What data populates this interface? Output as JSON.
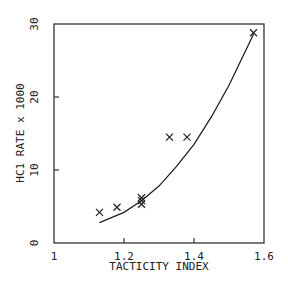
{
  "chart_data": {
    "type": "scatter",
    "title": "",
    "xlabel": "TACTICITY INDEX",
    "ylabel": "HC1 RATE x 1000",
    "xlim": [
      1.0,
      1.6
    ],
    "ylim": [
      0,
      30
    ],
    "x_ticks": [
      "1",
      "1.2",
      "1.4",
      "1.6"
    ],
    "y_ticks": [
      "0",
      "10",
      "20",
      "30"
    ],
    "grid": false,
    "series": [
      {
        "name": "data",
        "marker": "x",
        "points": [
          {
            "x": 1.13,
            "y": 4.2
          },
          {
            "x": 1.18,
            "y": 4.9
          },
          {
            "x": 1.25,
            "y": 5.3
          },
          {
            "x": 1.25,
            "y": 5.8
          },
          {
            "x": 1.25,
            "y": 6.2
          },
          {
            "x": 1.33,
            "y": 14.5
          },
          {
            "x": 1.38,
            "y": 14.5
          },
          {
            "x": 1.57,
            "y": 28.8
          }
        ]
      },
      {
        "name": "fit",
        "type": "line",
        "points": [
          {
            "x": 1.13,
            "y": 2.8
          },
          {
            "x": 1.2,
            "y": 4.2
          },
          {
            "x": 1.25,
            "y": 5.8
          },
          {
            "x": 1.3,
            "y": 7.8
          },
          {
            "x": 1.35,
            "y": 10.5
          },
          {
            "x": 1.4,
            "y": 13.5
          },
          {
            "x": 1.45,
            "y": 17.3
          },
          {
            "x": 1.5,
            "y": 21.6
          },
          {
            "x": 1.57,
            "y": 28.6
          }
        ]
      }
    ]
  }
}
